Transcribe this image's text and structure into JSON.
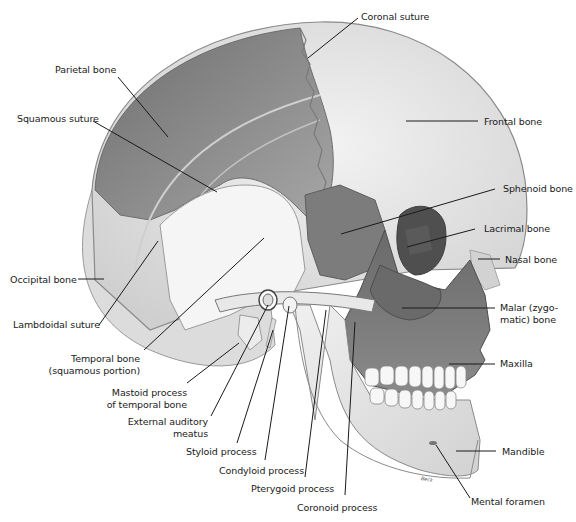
{
  "figure": {
    "artist_signature": "Beck",
    "colors": {
      "background": "#ffffff",
      "parietal": "#8f8f8f",
      "frontal": "#ebebeb",
      "occipital": "#dcdcdc",
      "temporal": "#f4f4f4",
      "sphenoid": "#7a7a7a",
      "malar": "#6f6f6f",
      "maxilla": "#666666",
      "mandible": "#e6e6e6",
      "teeth": "#f7f7f7",
      "nasal": "#cfcfcf",
      "leader_line": "#1a1a1a",
      "label_text": "#1a1a1a"
    }
  },
  "labels": {
    "coronal_suture": "Coronal suture",
    "parietal_bone": "Parietal bone",
    "squamous_suture": "Squamous suture",
    "frontal_bone": "Frontal bone",
    "sphenoid_bone": "Sphenoid bone",
    "lacrimal_bone": "Lacrimal bone",
    "nasal_bone": "Nasal bone",
    "occipital_bone": "Occipital bone",
    "lambdoidal_suture": "Lambdoidal suture",
    "malar_line1": "Malar (zygo-",
    "malar_line2": "matic) bone",
    "temporal_line1": "Temporal bone",
    "temporal_line2": "(squamous portion)",
    "maxilla": "Maxilla",
    "mastoid_line1": "Mastoid process",
    "mastoid_line2": "of temporal bone",
    "eam_line1": "External auditory",
    "eam_line2": "meatus",
    "styloid_process": "Styloid process",
    "condyloid_process": "Condyloid process",
    "pterygoid_process": "Pterygoid process",
    "coronoid_process": "Coronoid process",
    "mandible": "Mandible",
    "mental_foramen": "Mental foramen"
  }
}
